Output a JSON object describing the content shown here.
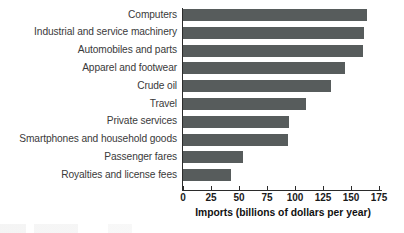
{
  "chart_data": {
    "type": "bar",
    "orientation": "horizontal",
    "title": "",
    "subtitle": "",
    "xlabel": "Imports (billions of dollars per year)",
    "ylabel": "",
    "xlim": [
      0,
      175
    ],
    "ylim": null,
    "grid": false,
    "legend": null,
    "xticks": [
      0,
      25,
      50,
      75,
      100,
      125,
      150,
      175
    ],
    "xtick_labels": [
      "0",
      "25",
      "50",
      "75",
      "100",
      "125",
      "150",
      "175"
    ],
    "categories": [
      "Computers",
      "Industrial and service machinery",
      "Automobiles and parts",
      "Apparel and footwear",
      "Crude oil",
      "Travel",
      "Private services",
      "Smartphones and household goods",
      "Passenger fares",
      "Royalties and license fees"
    ],
    "values": [
      164,
      162,
      161,
      145,
      132,
      110,
      95,
      94,
      54,
      43
    ],
    "bar_color": "#575c5c",
    "axis_color": "#2b2b2b",
    "label_color": "#3a3a3a"
  }
}
